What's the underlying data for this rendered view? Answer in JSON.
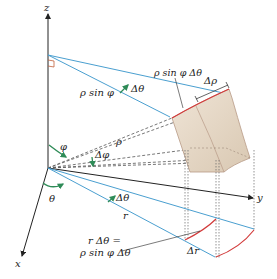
{
  "diagram": {
    "axes": {
      "x_label": "x",
      "y_label": "y",
      "z_label": "z"
    },
    "labels": {
      "rho_sin_phi": "ρ sin φ",
      "delta_theta_top": "Δθ",
      "rho_sin_phi_delta_theta_top": "ρ sin φ Δθ",
      "delta_rho": "Δρ",
      "phi": "φ",
      "rho": "ρ",
      "delta_phi": "Δφ",
      "theta": "θ",
      "delta_theta_bottom": "Δθ",
      "r": "r",
      "r_delta_theta_line1": "r Δθ =",
      "r_delta_theta_line2": "ρ sin φ Δθ",
      "delta_r": "Δr"
    },
    "colors": {
      "axis": "#222222",
      "blue_line": "#4a9fd0",
      "red_arc": "#d23a3a",
      "green_arrow": "#2e8b57",
      "box_fill": "#e8dccb",
      "box_edge": "#b89a86",
      "dashed": "#555555"
    }
  }
}
